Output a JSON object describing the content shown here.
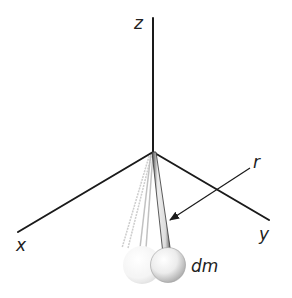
{
  "diagram": {
    "title": "",
    "axes": {
      "z": {
        "label": "z"
      },
      "x": {
        "label": "x"
      },
      "y": {
        "label": "y"
      }
    },
    "annotations": {
      "radius": {
        "label": "r"
      },
      "mass_element": {
        "label": "dm"
      }
    },
    "pendulum": {
      "ghost_positions": 2,
      "highlighted_position": 1
    },
    "colors": {
      "axis": "#1a1a1a",
      "rod": "#555555",
      "ghost": "#c8c8c8",
      "sphere_highlight": "#ffffff",
      "sphere_shadow": "#b0b0b0"
    }
  }
}
